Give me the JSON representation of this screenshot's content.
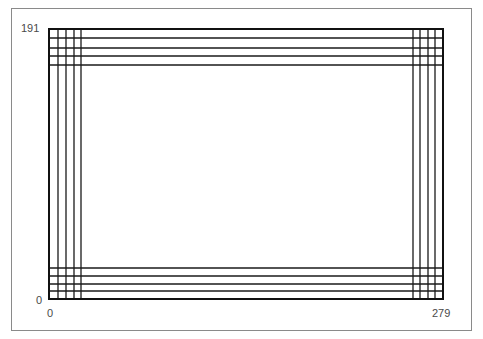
{
  "diagram": {
    "labels": {
      "y_max": "191",
      "y_min": "0",
      "x_min": "0",
      "x_max": "279"
    },
    "sheet_rect_px": {
      "x0": 49,
      "y0": 29,
      "x1": 443,
      "y1": 299
    },
    "left_verticals_px": [
      49,
      58,
      66,
      74,
      81
    ],
    "right_verticals_px": [
      413,
      420,
      428,
      435,
      443
    ],
    "top_horizontals_px": [
      29,
      38,
      48,
      56,
      65
    ],
    "bottom_horizontals_px": [
      268,
      276,
      284,
      291,
      299
    ],
    "line_color": "#1a1a1a",
    "frame_color": "#8a8a8a"
  }
}
